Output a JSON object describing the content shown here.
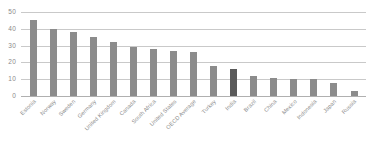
{
  "chart_data": {
    "type": "bar",
    "title": "",
    "subtitle": "",
    "xlabel": "",
    "ylabel": "",
    "ylim": [
      0,
      50
    ],
    "yticks": [
      0,
      10,
      20,
      30,
      40,
      50
    ],
    "ytick_labels": [
      "0",
      "10",
      "20",
      "30",
      "40",
      "50"
    ],
    "grid": true,
    "legend": "none",
    "categories": [
      "Estonia",
      "Norway",
      "Sweden",
      "Germany",
      "United Kingdom",
      "Canada",
      "South Africa",
      "United States",
      "OECD Average",
      "Turkey",
      "India",
      "Brazil",
      "China",
      "Mexico",
      "Indonesia",
      "Japan",
      "Russia"
    ],
    "values": [
      45,
      40,
      38,
      35,
      32,
      29,
      28,
      27,
      26,
      18,
      16,
      12,
      11,
      10,
      10,
      8,
      3
    ],
    "highlight_index": 10,
    "colors": {
      "bar": "#8c8c8c",
      "bar_highlight": "#5a5a5a",
      "gridline": "#c9c9c9",
      "axis": "#b0b0b0",
      "tick_text": "#8a8a8a",
      "background": "#ffffff"
    }
  }
}
